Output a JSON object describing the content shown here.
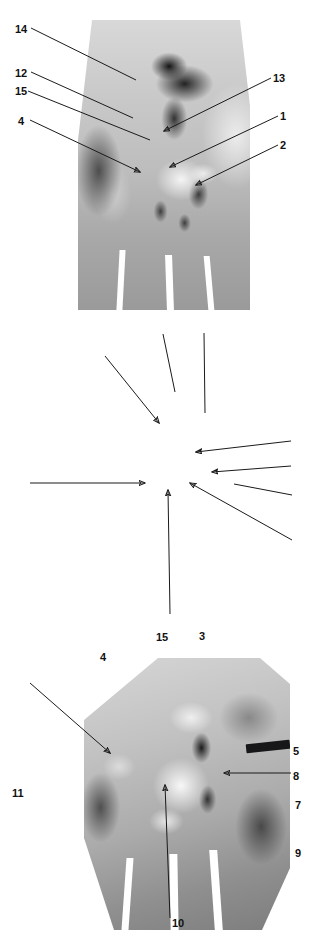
{
  "page": {
    "header_text": "",
    "figure_caption": ""
  },
  "panels": [
    {
      "id": "panel-1",
      "name": "dorsal-view-plate",
      "numeric_labels": [
        {
          "text": "14",
          "side": "left"
        },
        {
          "text": "12",
          "side": "left"
        },
        {
          "text": "15",
          "side": "left"
        },
        {
          "text": "4",
          "side": "left"
        },
        {
          "text": "13",
          "side": "right"
        },
        {
          "text": "1",
          "side": "right"
        },
        {
          "text": "2",
          "side": "right"
        }
      ],
      "letter_labels": []
    },
    {
      "id": "panel-2",
      "name": "oblique-view-plate",
      "numeric_labels": [
        {
          "text": "15",
          "side": "top"
        },
        {
          "text": "3",
          "side": "top"
        },
        {
          "text": "4",
          "side": "top-left"
        },
        {
          "text": "11",
          "side": "left"
        },
        {
          "text": "5",
          "side": "right"
        },
        {
          "text": "8",
          "side": "right"
        },
        {
          "text": "7",
          "side": "right"
        },
        {
          "text": "9",
          "side": "right"
        },
        {
          "text": "10",
          "side": "bottom"
        }
      ],
      "letter_labels": []
    },
    {
      "id": "panel-3",
      "name": "articular-surface-plate",
      "numeric_labels": [
        {
          "text": "4",
          "side": "left"
        },
        {
          "text": "6",
          "side": "right"
        },
        {
          "text": "5",
          "side": "bottom"
        }
      ],
      "letter_labels": [
        {
          "text": "B"
        },
        {
          "text": "C"
        },
        {
          "text": "A"
        },
        {
          "text": "D"
        },
        {
          "text": "D'"
        },
        {
          "text": "A'"
        },
        {
          "text": "C'"
        },
        {
          "text": "B'"
        }
      ]
    }
  ],
  "colors": {
    "background": "#ffffff",
    "label_text": "#111111",
    "leader_line": "#1a1a1a",
    "probe": "#17171a"
  }
}
